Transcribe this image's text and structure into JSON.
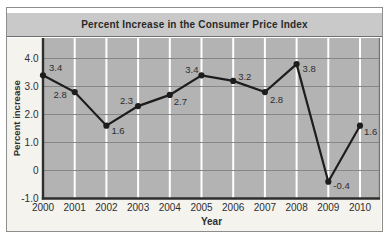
{
  "figure": {
    "title": "Percent Increase in the Consumer Price Index"
  },
  "chart_data": {
    "type": "line",
    "title": "Percent Increase in the Consumer Price Index",
    "xlabel": "Year",
    "ylabel": "Percent increase",
    "categories": [
      "2000",
      "2001",
      "2002",
      "2003",
      "2004",
      "2005",
      "2006",
      "2007",
      "2008",
      "2009",
      "2010"
    ],
    "values": [
      3.4,
      2.8,
      1.6,
      2.3,
      2.7,
      3.4,
      3.2,
      2.8,
      3.8,
      -0.4,
      1.6
    ],
    "point_labels": [
      "3.4",
      "2.8",
      "1.6",
      "2.3",
      "2.7",
      "3.4",
      "3.2",
      "2.8",
      "3.8",
      "-0.4",
      "1.6"
    ],
    "yticks": [
      {
        "v": 4,
        "label": "4.0"
      },
      {
        "v": 3,
        "label": "3.0"
      },
      {
        "v": 2,
        "label": "2.0"
      },
      {
        "v": 1,
        "label": "1.0"
      },
      {
        "v": 0,
        "label": "0"
      },
      {
        "v": -1,
        "label": "-1.0"
      }
    ],
    "ylim": [
      -1.0,
      4.0
    ],
    "grid": {
      "horizontal": "dark-gray lines at integers",
      "vertical": "white lines at each year"
    },
    "legend": "none",
    "label_offsets": [
      {
        "a": "start",
        "dx": 6,
        "dy": -4
      },
      {
        "a": "end",
        "dx": -8,
        "dy": 6
      },
      {
        "a": "start",
        "dx": 5,
        "dy": 8
      },
      {
        "a": "end",
        "dx": -5,
        "dy": -2
      },
      {
        "a": "start",
        "dx": 4,
        "dy": 10
      },
      {
        "a": "end",
        "dx": -3,
        "dy": -2
      },
      {
        "a": "start",
        "dx": 5,
        "dy": -1
      },
      {
        "a": "start",
        "dx": 5,
        "dy": 11
      },
      {
        "a": "start",
        "dx": 6,
        "dy": 8
      },
      {
        "a": "start",
        "dx": 5,
        "dy": 7
      },
      {
        "a": "start",
        "dx": 4,
        "dy": 9
      }
    ],
    "colors": {
      "line": "#1d1d1d",
      "marker": "#1d1d1d",
      "plot_bg": "#b3b3b3",
      "margin_bg": "#f4f3ee",
      "title_bg": "#c9c9c9",
      "gridline_dark": "#878787",
      "gridline_white": "#ffffff",
      "axis": "#2e2e2e",
      "plot_right_border": "#757575",
      "text": "#2e2e2e"
    }
  }
}
